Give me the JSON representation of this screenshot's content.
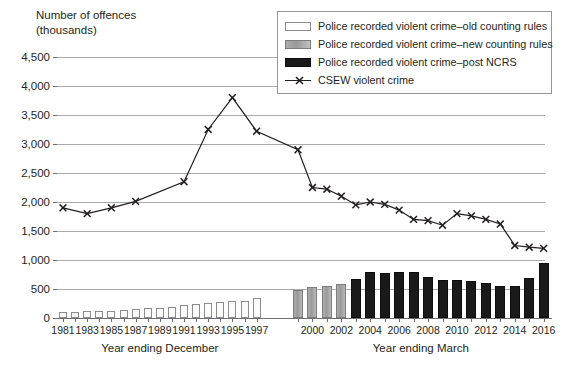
{
  "axis": {
    "ylabel_line1": "Number of offences",
    "ylabel_line2": "(thousands)",
    "yticks": [
      "0",
      "500",
      "1,000",
      "1,500",
      "2,000",
      "2,500",
      "3,000",
      "3,500",
      "4,000",
      "4,500"
    ],
    "xcaption_left": "Year ending December",
    "xcaption_right": "Year ending March"
  },
  "legend": {
    "items": [
      {
        "key": "old",
        "label": "Police recorded violent crime–old counting rules"
      },
      {
        "key": "new",
        "label": "Police recorded violent crime–new counting rules"
      },
      {
        "key": "post",
        "label": "Police recorded violent crime–post NCRS"
      },
      {
        "key": "line",
        "label": "CSEW violent crime"
      }
    ]
  },
  "chart_data": {
    "type": "bar",
    "title": "",
    "xlabel": "",
    "ylabel": "Number of offences (thousands)",
    "ylim": [
      0,
      4500
    ],
    "ytick_step": 500,
    "grid": true,
    "legend_position": "top-right",
    "left_panel_label": "Year ending December",
    "right_panel_label": "Year ending March",
    "left_xticks": [
      "1981",
      "1983",
      "1985",
      "1987",
      "1989",
      "1991",
      "1993",
      "1995",
      "1997"
    ],
    "right_xticks": [
      "2000",
      "2002",
      "2004",
      "2006",
      "2008",
      "2010",
      "2012",
      "2014",
      "2016"
    ],
    "series": [
      {
        "name": "Police recorded violent crime–old counting rules",
        "type": "bar",
        "color": "#fbfbfb",
        "categories": [
          "1981",
          "1982",
          "1983",
          "1984",
          "1985",
          "1986",
          "1987",
          "1988",
          "1989",
          "1990",
          "1991",
          "1992",
          "1993",
          "1994",
          "1995",
          "1996",
          "1997"
        ],
        "values": [
          100,
          105,
          115,
          120,
          125,
          140,
          155,
          165,
          180,
          195,
          225,
          250,
          260,
          270,
          285,
          300,
          345
        ]
      },
      {
        "name": "Police recorded violent crime–new counting rules",
        "type": "bar",
        "color": "#a0a0a0",
        "categories": [
          "1999",
          "2000",
          "2001",
          "2002"
        ],
        "values": [
          480,
          530,
          545,
          595
        ]
      },
      {
        "name": "Police recorded violent crime–post NCRS",
        "type": "bar",
        "color": "#1a1a1a",
        "categories": [
          "2003",
          "2004",
          "2005",
          "2006",
          "2007",
          "2008",
          "2009",
          "2010",
          "2011",
          "2012",
          "2013",
          "2014",
          "2015",
          "2016"
        ],
        "values": [
          680,
          790,
          775,
          800,
          790,
          700,
          660,
          650,
          630,
          600,
          560,
          545,
          690,
          940
        ]
      },
      {
        "name": "CSEW violent crime",
        "type": "line",
        "marker": "x",
        "color": "#231f20",
        "x": [
          "1981",
          "1983",
          "1985",
          "1987",
          "1991",
          "1993",
          "1995",
          "1997",
          "1999",
          "2000",
          "2001",
          "2002",
          "2003",
          "2004",
          "2005",
          "2006",
          "2007",
          "2008",
          "2009",
          "2010",
          "2011",
          "2012",
          "2013",
          "2014",
          "2015",
          "2016"
        ],
        "values": [
          1900,
          1800,
          1900,
          2010,
          2350,
          3250,
          3800,
          3220,
          2900,
          2250,
          2220,
          2100,
          1950,
          2000,
          1960,
          1860,
          1700,
          1680,
          1600,
          1800,
          1760,
          1700,
          1620,
          1250,
          1220,
          1200
        ]
      }
    ]
  }
}
